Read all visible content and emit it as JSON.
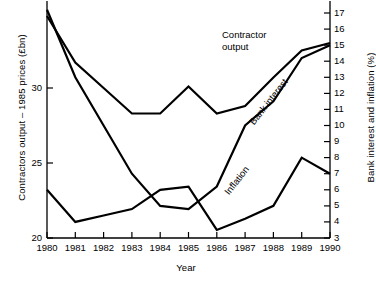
{
  "chart_data": {
    "type": "line",
    "title": "",
    "xlabel": "Year",
    "ylabel": "Contractors output – 1985 prices (£bn)",
    "ylabel_right": "Bank interest and inflation (%)",
    "x": [
      1980,
      1981,
      1982,
      1983,
      1984,
      1985,
      1986,
      1987,
      1988,
      1989,
      1990
    ],
    "xlim": [
      1980,
      1990
    ],
    "xticklabels": [
      "1980",
      "1981",
      "1982",
      "1983",
      "1984",
      "1985",
      "1986",
      "1987",
      "1988",
      "1989",
      "1990"
    ],
    "ylim_left": [
      20,
      35
    ],
    "yticks_left": [
      20,
      25,
      30
    ],
    "yticklabels_left": [
      "20",
      "25",
      "30"
    ],
    "ylim_right": [
      3,
      17
    ],
    "yticks_right": [
      3,
      4,
      5,
      6,
      7,
      8,
      9,
      10,
      11,
      12,
      13,
      14,
      15,
      16,
      17
    ],
    "yticklabels_right": [
      "3",
      "4",
      "5",
      "6",
      "7",
      "8",
      "9",
      "10",
      "11",
      "12",
      "13",
      "14",
      "15",
      "16",
      "17"
    ],
    "grid": false,
    "legend_position": "inline-annotations",
    "line_color": "#000000",
    "series": [
      {
        "name": "Contractor output",
        "axis": "left",
        "units": "£bn (1985 prices)",
        "values": [
          34.8,
          31.7,
          30.0,
          28.3,
          28.3,
          30.1,
          28.3,
          28.8,
          30.7,
          32.5,
          33.0
        ]
      },
      {
        "name": "Bank interest",
        "axis": "right",
        "units": "%",
        "values": [
          17.2,
          13.0,
          10.0,
          7.0,
          5.0,
          4.8,
          6.2,
          10.0,
          11.5,
          14.2,
          15.0
        ]
      },
      {
        "name": "Inflation",
        "axis": "right",
        "units": "%",
        "values": [
          6.0,
          4.0,
          4.4,
          4.8,
          6.0,
          6.2,
          3.5,
          4.2,
          5.0,
          8.0,
          7.0
        ]
      }
    ],
    "annotations": [
      {
        "name": "contractor-output-label",
        "text": "Contractor\noutput"
      },
      {
        "name": "bank-interest-label",
        "text": "Bank interest"
      },
      {
        "name": "inflation-label",
        "text": "Inflation"
      }
    ]
  }
}
